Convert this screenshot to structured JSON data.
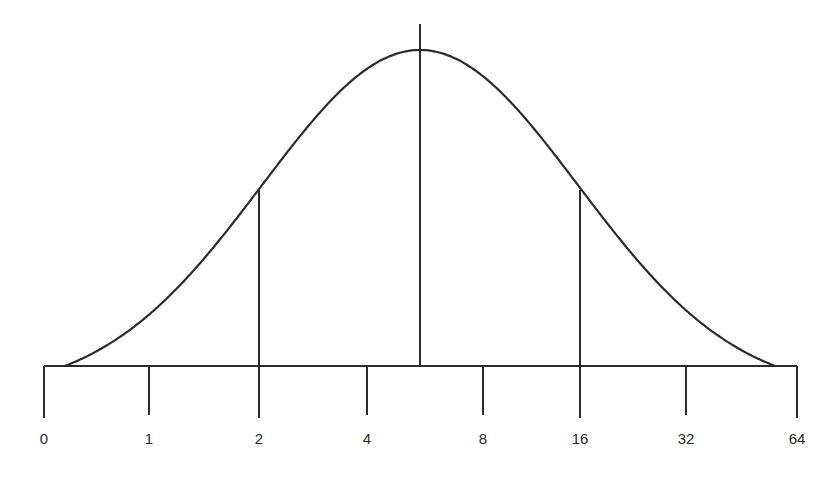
{
  "chart_data": {
    "type": "line",
    "title": "",
    "xlabel": "",
    "ylabel": "",
    "x_scale": "log2",
    "tick_labels": [
      "0",
      "1",
      "2",
      "4",
      "8",
      "16",
      "32",
      "64"
    ],
    "tick_pixel_x": [
      44,
      149,
      259,
      367,
      483,
      580,
      686,
      797
    ],
    "axis": {
      "y": 366,
      "x_start": 44,
      "x_end": 797,
      "tick_bottom": 418
    },
    "reference_lines": [
      {
        "name": "lower",
        "x": 259,
        "top": 190,
        "label_at": "2"
      },
      {
        "name": "center",
        "x": 420,
        "top": 24,
        "label_at": "between 4 and 8"
      },
      {
        "name": "upper",
        "x": 580,
        "top": 190,
        "label_at": "16"
      }
    ],
    "curve": {
      "peak_x": 420,
      "peak_y": 50,
      "start_x": 60,
      "end_x": 775,
      "baseline_y": 366
    },
    "grid": false,
    "legend": null
  },
  "colors": {
    "line": "#2b2b2b",
    "background": "#ffffff"
  }
}
